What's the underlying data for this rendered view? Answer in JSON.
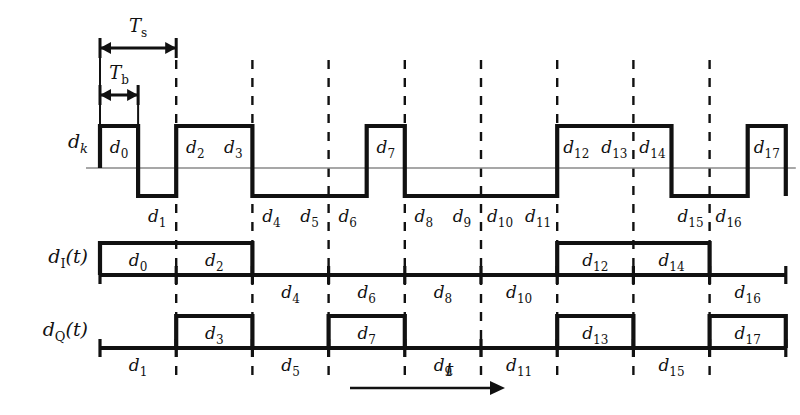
{
  "figure": {
    "type": "timing-diagram",
    "time_axis_label": "t",
    "period_markers": [
      {
        "name": "Ts",
        "base": "T",
        "sub": "s",
        "bits": 2
      },
      {
        "name": "Tb",
        "base": "T",
        "sub": "b",
        "bits": 1
      }
    ],
    "geometry": {
      "x_start": 100,
      "bit_width": 38.1,
      "bit_count": 18,
      "dashed_every_bits": 2,
      "dashed_top": 60,
      "dashed_bottom": 375
    }
  },
  "rows": [
    {
      "id": "dk",
      "label_base": "d",
      "label_sub": "k",
      "label_suffix": "",
      "baseline_y": 168,
      "high_y": 126,
      "low_y": 196,
      "kind": "bipolar",
      "bit_span": 1,
      "segments": [
        {
          "label_base": "d",
          "label_sub": "0",
          "start": 0,
          "span": 1,
          "level": "high"
        },
        {
          "label_base": "d",
          "label_sub": "1",
          "start": 1,
          "span": 1,
          "level": "low"
        },
        {
          "label_base": "d",
          "label_sub": "2",
          "start": 2,
          "span": 1,
          "level": "high"
        },
        {
          "label_base": "d",
          "label_sub": "3",
          "start": 3,
          "span": 1,
          "level": "high"
        },
        {
          "label_base": "d",
          "label_sub": "4",
          "start": 4,
          "span": 1,
          "level": "low"
        },
        {
          "label_base": "d",
          "label_sub": "5",
          "start": 5,
          "span": 1,
          "level": "low"
        },
        {
          "label_base": "d",
          "label_sub": "6",
          "start": 6,
          "span": 1,
          "level": "low"
        },
        {
          "label_base": "d",
          "label_sub": "7",
          "start": 7,
          "span": 1,
          "level": "high"
        },
        {
          "label_base": "d",
          "label_sub": "8",
          "start": 8,
          "span": 1,
          "level": "low"
        },
        {
          "label_base": "d",
          "label_sub": "9",
          "start": 9,
          "span": 1,
          "level": "low"
        },
        {
          "label_base": "d",
          "label_sub": "10",
          "start": 10,
          "span": 1,
          "level": "low"
        },
        {
          "label_base": "d",
          "label_sub": "11",
          "start": 11,
          "span": 1,
          "level": "low"
        },
        {
          "label_base": "d",
          "label_sub": "12",
          "start": 12,
          "span": 1,
          "level": "high"
        },
        {
          "label_base": "d",
          "label_sub": "13",
          "start": 13,
          "span": 1,
          "level": "high"
        },
        {
          "label_base": "d",
          "label_sub": "14",
          "start": 14,
          "span": 1,
          "level": "high"
        },
        {
          "label_base": "d",
          "label_sub": "15",
          "start": 15,
          "span": 1,
          "level": "low"
        },
        {
          "label_base": "d",
          "label_sub": "16",
          "start": 16,
          "span": 1,
          "level": "low"
        },
        {
          "label_base": "d",
          "label_sub": "17",
          "start": 17,
          "span": 1,
          "level": "high"
        }
      ]
    },
    {
      "id": "dI",
      "label_base": "d",
      "label_sub": "I",
      "label_suffix": "(t)",
      "baseline_y": 275,
      "high_y": 243,
      "low_y": 275,
      "kind": "unipolar",
      "bit_span": 2,
      "segments": [
        {
          "label_base": "d",
          "label_sub": "0",
          "start": 0,
          "span": 2,
          "level": "high"
        },
        {
          "label_base": "d",
          "label_sub": "2",
          "start": 2,
          "span": 2,
          "level": "high"
        },
        {
          "label_base": "d",
          "label_sub": "4",
          "start": 4,
          "span": 2,
          "level": "low"
        },
        {
          "label_base": "d",
          "label_sub": "6",
          "start": 6,
          "span": 2,
          "level": "low"
        },
        {
          "label_base": "d",
          "label_sub": "8",
          "start": 8,
          "span": 2,
          "level": "low"
        },
        {
          "label_base": "d",
          "label_sub": "10",
          "start": 10,
          "span": 2,
          "level": "low"
        },
        {
          "label_base": "d",
          "label_sub": "12",
          "start": 12,
          "span": 2,
          "level": "high"
        },
        {
          "label_base": "d",
          "label_sub": "14",
          "start": 14,
          "span": 2,
          "level": "high"
        },
        {
          "label_base": "d",
          "label_sub": "16",
          "start": 16,
          "span": 2,
          "level": "low"
        }
      ]
    },
    {
      "id": "dQ",
      "label_base": "d",
      "label_sub": "Q",
      "label_suffix": "(t)",
      "baseline_y": 348,
      "high_y": 316,
      "low_y": 348,
      "kind": "unipolar",
      "bit_span": 2,
      "segments": [
        {
          "label_base": "d",
          "label_sub": "1",
          "start": 0,
          "span": 2,
          "level": "low"
        },
        {
          "label_base": "d",
          "label_sub": "3",
          "start": 2,
          "span": 2,
          "level": "high"
        },
        {
          "label_base": "d",
          "label_sub": "5",
          "start": 4,
          "span": 2,
          "level": "low"
        },
        {
          "label_base": "d",
          "label_sub": "7",
          "start": 6,
          "span": 2,
          "level": "high"
        },
        {
          "label_base": "d",
          "label_sub": "9",
          "start": 8,
          "span": 2,
          "level": "low"
        },
        {
          "label_base": "d",
          "label_sub": "11",
          "start": 10,
          "span": 2,
          "level": "low"
        },
        {
          "label_base": "d",
          "label_sub": "13",
          "start": 12,
          "span": 2,
          "level": "high"
        },
        {
          "label_base": "d",
          "label_sub": "15",
          "start": 14,
          "span": 2,
          "level": "low"
        },
        {
          "label_base": "d",
          "label_sub": "17",
          "start": 16,
          "span": 2,
          "level": "high"
        }
      ]
    }
  ],
  "colors": {
    "ink": "#111111",
    "thin_rule": "#8a8a8a",
    "background": "#ffffff"
  }
}
